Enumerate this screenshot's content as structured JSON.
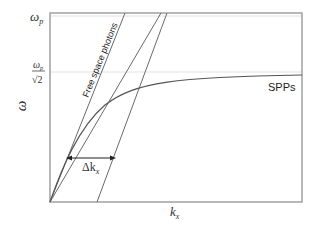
{
  "diagram": {
    "axes": {
      "x_label": "k",
      "x_label_subscript": "x",
      "y_label": "ω",
      "y_ticks": [
        {
          "label": "ω",
          "subscript": "p",
          "position": "top"
        },
        {
          "label_numerator": "ω",
          "numerator_subscript": "p",
          "label_denominator": "√2",
          "position": "asymptote"
        }
      ]
    },
    "curves": {
      "spp_label": "SPPs",
      "free_space_label": "Free space photons"
    },
    "annotation": {
      "delta_label": "Δk",
      "delta_subscript": "x"
    },
    "colors": {
      "frame": "#9a9a9a",
      "lines": "#6a6a6a",
      "guide": "#e2e2e2",
      "text": "#333333"
    }
  }
}
